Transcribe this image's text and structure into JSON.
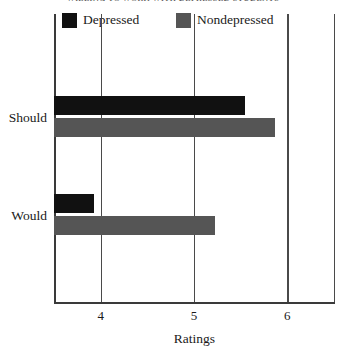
{
  "chart_data": {
    "type": "bar",
    "orientation": "horizontal",
    "title": "WILLING TO WORK WITH DEPRESSED STUDENTS",
    "xlabel": "Ratings",
    "ylabel": "",
    "categories": [
      "Should",
      "Would"
    ],
    "series": [
      {
        "name": "Depressed",
        "color": "#111111",
        "values": [
          5.55,
          3.93
        ]
      },
      {
        "name": "Nondepressed",
        "color": "#555555",
        "values": [
          5.87,
          5.23
        ]
      }
    ],
    "xlim": [
      3.5,
      6.5
    ],
    "xticks": [
      4,
      5,
      6
    ],
    "xtick_labels": [
      "4",
      "5",
      "6"
    ],
    "grid": true,
    "legend_position": "top"
  },
  "legend": {
    "items": [
      {
        "label": "Depressed",
        "swatch": "#111111"
      },
      {
        "label": "Nondepressed",
        "swatch": "#555555"
      }
    ]
  },
  "axis": {
    "x_title": "Ratings",
    "ticks": [
      {
        "label": "4",
        "value": 4
      },
      {
        "label": "5",
        "value": 5
      },
      {
        "label": "6",
        "value": 6
      }
    ]
  },
  "categories": [
    {
      "label": "Should"
    },
    {
      "label": "Would"
    }
  ]
}
